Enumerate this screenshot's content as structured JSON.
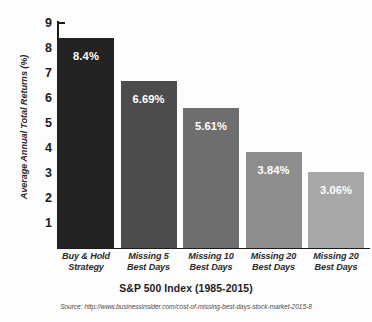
{
  "chart_data": {
    "type": "bar",
    "title": "",
    "xlabel": "S&P 500 Index (1985-2015)",
    "ylabel": "Average Annual Total Returns (%)",
    "categories": [
      "Buy & Hold Strategy",
      "Missing 5 Best Days",
      "Missing 10 Best Days",
      "Missing 20 Best Days",
      "Missing 20 Best Days"
    ],
    "category_lines": [
      [
        "Buy & Hold",
        "Strategy"
      ],
      [
        "Missing 5",
        "Best Days"
      ],
      [
        "Missing 10",
        "Best Days"
      ],
      [
        "Missing 20",
        "Best Days"
      ],
      [
        "Missing 20",
        "Best Days"
      ]
    ],
    "values": [
      8.4,
      6.69,
      5.61,
      3.84,
      3.06
    ],
    "value_labels": [
      "8.4%",
      "6.69%",
      "5.61%",
      "3.84%",
      "3.06%"
    ],
    "bar_colors": [
      "#232323",
      "#4c4c4c",
      "#6e6e6e",
      "#8d8d8d",
      "#a8a8a8"
    ],
    "ylim": [
      0,
      9
    ],
    "ytick_labels": [
      "1",
      "2",
      "3",
      "4",
      "5",
      "6",
      "7",
      "8",
      "9"
    ],
    "ytick_values": [
      1,
      2,
      3,
      4,
      5,
      6,
      7,
      8,
      9
    ],
    "grid": false,
    "legend": "none",
    "source": "Source: http://www.businessinsider.com/cost-of-missing-best-days-stock-market-2015-8"
  }
}
